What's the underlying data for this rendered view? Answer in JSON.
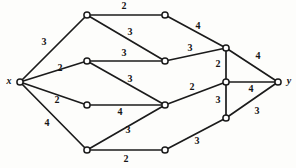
{
  "figure": {
    "name": "weighted-network-graph",
    "background_color": "#fdfdfb",
    "edge_color": "#1b1b1b",
    "node_fill": "#ffffff",
    "node_stroke": "#1b1b1b",
    "width": 296,
    "height": 168
  },
  "chart_data": {
    "type": "diagram",
    "title": "",
    "subtitle": "",
    "xlabel": "",
    "ylabel": "",
    "grid": false,
    "legend": null,
    "source_node": "x",
    "sink_node": "y",
    "nodes": [
      {
        "id": "x",
        "label": "x",
        "x": 20,
        "y": 82,
        "labeled": true,
        "label_dx": -11,
        "label_dy": 0
      },
      {
        "id": "a",
        "label": "",
        "x": 87,
        "y": 15,
        "labeled": false,
        "label_dx": 0,
        "label_dy": 0
      },
      {
        "id": "b",
        "label": "",
        "x": 165,
        "y": 15,
        "labeled": false,
        "label_dx": 0,
        "label_dy": 0
      },
      {
        "id": "c",
        "label": "",
        "x": 87,
        "y": 61,
        "labeled": false,
        "label_dx": 0,
        "label_dy": 0
      },
      {
        "id": "d",
        "label": "",
        "x": 165,
        "y": 61,
        "labeled": false,
        "label_dx": 0,
        "label_dy": 0
      },
      {
        "id": "e",
        "label": "",
        "x": 87,
        "y": 105,
        "labeled": false,
        "label_dx": 0,
        "label_dy": 0
      },
      {
        "id": "f",
        "label": "",
        "x": 165,
        "y": 105,
        "labeled": false,
        "label_dx": 0,
        "label_dy": 0
      },
      {
        "id": "g",
        "label": "",
        "x": 87,
        "y": 150,
        "labeled": false,
        "label_dx": 0,
        "label_dy": 0
      },
      {
        "id": "h",
        "label": "",
        "x": 165,
        "y": 150,
        "labeled": false,
        "label_dx": 0,
        "label_dy": 0
      },
      {
        "id": "u",
        "label": "",
        "x": 226,
        "y": 48,
        "labeled": false,
        "label_dx": 0,
        "label_dy": 0
      },
      {
        "id": "m",
        "label": "",
        "x": 226,
        "y": 82,
        "labeled": false,
        "label_dx": 0,
        "label_dy": 0
      },
      {
        "id": "l",
        "label": "",
        "x": 226,
        "y": 118,
        "labeled": false,
        "label_dx": 0,
        "label_dy": 0
      },
      {
        "id": "y",
        "label": "y",
        "x": 278,
        "y": 82,
        "labeled": true,
        "label_dx": 11,
        "label_dy": 0
      }
    ],
    "edges": [
      {
        "from": "x",
        "to": "a",
        "weight": 3,
        "label_x": 44,
        "label_y": 43
      },
      {
        "from": "a",
        "to": "b",
        "weight": 2,
        "label_x": 124,
        "label_y": 7
      },
      {
        "from": "a",
        "to": "d",
        "weight": 3,
        "label_x": 130,
        "label_y": 33
      },
      {
        "from": "b",
        "to": "u",
        "weight": 4,
        "label_x": 198,
        "label_y": 27
      },
      {
        "from": "x",
        "to": "c",
        "weight": 2,
        "label_x": 60,
        "label_y": 69
      },
      {
        "from": "c",
        "to": "d",
        "weight": 3,
        "label_x": 124,
        "label_y": 54
      },
      {
        "from": "c",
        "to": "f",
        "weight": 3,
        "label_x": 130,
        "label_y": 80
      },
      {
        "from": "d",
        "to": "u",
        "weight": 3,
        "label_x": 190,
        "label_y": 49
      },
      {
        "from": "x",
        "to": "e",
        "weight": 2,
        "label_x": 57,
        "label_y": 101
      },
      {
        "from": "e",
        "to": "f",
        "weight": 4,
        "label_x": 120,
        "label_y": 113
      },
      {
        "from": "x",
        "to": "g",
        "weight": 4,
        "label_x": 47,
        "label_y": 124
      },
      {
        "from": "g",
        "to": "f",
        "weight": 3,
        "label_x": 128,
        "label_y": 131
      },
      {
        "from": "g",
        "to": "h",
        "weight": 2,
        "label_x": 126,
        "label_y": 160
      },
      {
        "from": "h",
        "to": "l",
        "weight": 3,
        "label_x": 197,
        "label_y": 142
      },
      {
        "from": "f",
        "to": "m",
        "weight": 2,
        "label_x": 192,
        "label_y": 88
      },
      {
        "from": "u",
        "to": "m",
        "weight": 2,
        "label_x": 218,
        "label_y": 65
      },
      {
        "from": "m",
        "to": "l",
        "weight": 3,
        "label_x": 218,
        "label_y": 101
      },
      {
        "from": "u",
        "to": "y",
        "weight": 4,
        "label_x": 258,
        "label_y": 57
      },
      {
        "from": "m",
        "to": "y",
        "weight": 4,
        "label_x": 251,
        "label_y": 90
      },
      {
        "from": "l",
        "to": "y",
        "weight": 3,
        "label_x": 257,
        "label_y": 112
      }
    ],
    "node_radius": 3.1
  }
}
